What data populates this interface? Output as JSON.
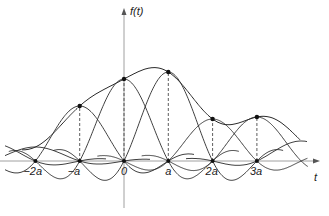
{
  "figure": {
    "y_axis_label": "f(t)",
    "x_axis_label": "t",
    "tick_labels": [
      "−2a",
      "−a",
      "0",
      "a",
      "2a",
      "3a"
    ],
    "sample_positions": [
      -2,
      -1,
      0,
      1,
      2,
      3
    ],
    "sample_values": [
      0,
      55,
      82,
      89,
      42,
      44
    ],
    "line_color": "#2a2a2a",
    "axis_color": "#888888"
  },
  "layout": {
    "origin_x": 124,
    "axis_y": 161,
    "spacing": 44.3,
    "x_axis_start": 0,
    "x_axis_end": 320,
    "y_axis_top": 8,
    "y_axis_bottom": 208
  }
}
